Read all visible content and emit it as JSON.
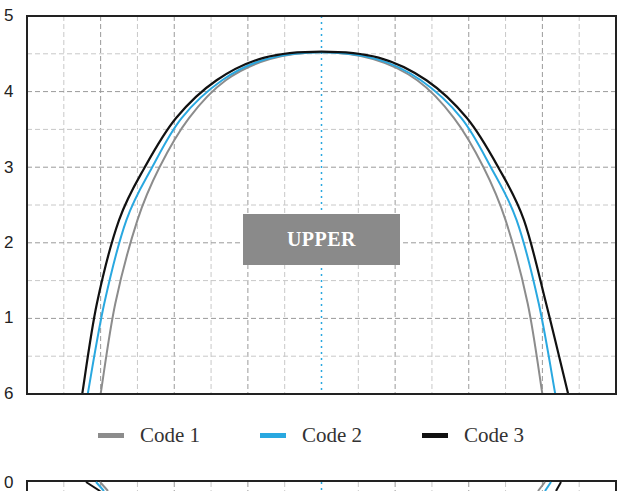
{
  "chart_data": {
    "type": "line",
    "title": "",
    "annotation": "UPPER",
    "xlabel": "",
    "ylabel": "",
    "grid": true,
    "legend_position": "bottom",
    "y_tick_labels": [
      "6",
      "1",
      "2",
      "3",
      "4",
      "5"
    ],
    "y_tick_values": [
      0,
      1,
      2,
      3,
      4,
      5
    ],
    "ylim": [
      0,
      5
    ],
    "x_range": [
      -8,
      8
    ],
    "center_line": {
      "x": 0,
      "color": "#29a8e0",
      "style": "dotted"
    },
    "series": [
      {
        "name": "Code 1",
        "color": "#8c8c8c",
        "x": [
          -6.0,
          -5.6,
          -5.0,
          -4.4,
          -3.6,
          -2.6,
          -1.4,
          0.0,
          1.4,
          2.6,
          3.6,
          4.4,
          5.0,
          5.6,
          6.0
        ],
        "y": [
          0.0,
          1.2,
          2.3,
          3.0,
          3.65,
          4.15,
          4.43,
          4.52,
          4.43,
          4.15,
          3.65,
          3.0,
          2.3,
          1.2,
          0.0
        ]
      },
      {
        "name": "Code 2",
        "color": "#29a8e0",
        "x": [
          -6.35,
          -5.9,
          -5.3,
          -4.6,
          -3.8,
          -2.7,
          -1.5,
          0.0,
          1.5,
          2.7,
          3.8,
          4.6,
          5.3,
          5.9,
          6.35
        ],
        "y": [
          0.0,
          1.2,
          2.3,
          3.0,
          3.65,
          4.15,
          4.43,
          4.52,
          4.43,
          4.15,
          3.65,
          3.0,
          2.3,
          1.2,
          0.0
        ]
      },
      {
        "name": "Code 3",
        "color": "#111111",
        "x": [
          -6.5,
          -6.1,
          -5.5,
          -4.8,
          -3.95,
          -2.85,
          -1.55,
          0.0,
          1.55,
          2.85,
          3.95,
          4.8,
          5.5,
          6.1,
          6.7
        ],
        "y": [
          0.0,
          1.2,
          2.3,
          3.0,
          3.65,
          4.15,
          4.45,
          4.53,
          4.45,
          4.15,
          3.65,
          3.0,
          2.3,
          1.2,
          0.0
        ]
      }
    ]
  },
  "legend": {
    "items": [
      {
        "label": "Code 1",
        "color": "#8c8c8c"
      },
      {
        "label": "Code 2",
        "color": "#29a8e0"
      },
      {
        "label": "Code 3",
        "color": "#111111"
      }
    ]
  },
  "lower_panel": {
    "y_tick_label": "0"
  }
}
